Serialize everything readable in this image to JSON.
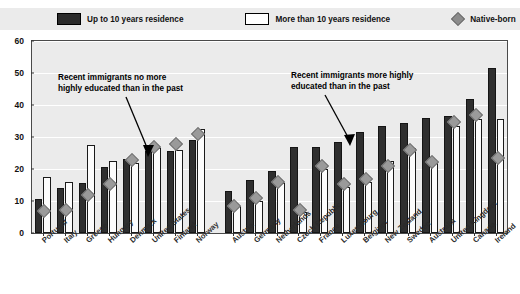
{
  "legend": {
    "items": [
      {
        "label": "Up to 10 years residence",
        "icon": "dark-square-swatch",
        "color": "#2b2b2b"
      },
      {
        "label": "More than 10 years residence",
        "icon": "light-square-swatch",
        "color": "#ffffff"
      },
      {
        "label": "Native-born",
        "icon": "grey-diamond-marker",
        "color": "#8c8c8c"
      }
    ]
  },
  "annotations": [
    {
      "name": "left-annotation",
      "line1": "Recent immigrants no more",
      "line2": "highly educated than in the past"
    },
    {
      "name": "right-annotation",
      "line1": "Recent immigrants more highly",
      "line2": "educated than in the past"
    }
  ],
  "chart_data": {
    "type": "bar",
    "title": "",
    "xlabel": "",
    "ylabel": "",
    "ylim": [
      0,
      60
    ],
    "yticks": [
      0,
      10,
      20,
      30,
      40,
      50,
      60
    ],
    "grid": true,
    "legend_position": "top",
    "groups": [
      {
        "name": "no-more-highly-educated",
        "categories": [
          "Portugal",
          "Italy",
          "Greece",
          "Hungary",
          "Denmark",
          "United States",
          "Finland",
          "Norway"
        ],
        "series": [
          {
            "name": "Up to 10 years residence",
            "values": [
              10.5,
              14.0,
              15.5,
              20.5,
              23.0,
              25.5,
              25.5,
              29.0
            ]
          },
          {
            "name": "More than 10 years residence",
            "values": [
              17.5,
              16.0,
              27.5,
              22.5,
              22.0,
              26.5,
              26.0,
              32.5
            ]
          },
          {
            "name": "Native-born",
            "values": [
              6.5,
              7.0,
              11.5,
              15.0,
              22.5,
              26.5,
              27.5,
              30.5
            ]
          }
        ]
      },
      {
        "name": "more-highly-educated",
        "categories": [
          "Austria",
          "Germany",
          "Netherlands",
          "Czech Republic",
          "France",
          "Luxembourg",
          "Belgium",
          "New Zealand",
          "Sweden",
          "Australia",
          "United Kingdom",
          "Canada",
          "Ireland"
        ],
        "series": [
          {
            "name": "Up to 10 years residence",
            "values": [
              13.0,
              16.5,
              19.5,
              27.0,
              27.0,
              28.5,
              31.5,
              33.5,
              34.5,
              36.0,
              36.5,
              42.0,
              51.5
            ]
          },
          {
            "name": "More than 10 years residence",
            "values": [
              8.5,
              10.0,
              15.5,
              6.5,
              20.0,
              14.5,
              16.0,
              22.5,
              26.5,
              22.5,
              33.5,
              35.5,
              35.5
            ]
          },
          {
            "name": "Native-born",
            "values": [
              8.0,
              10.5,
              15.5,
              7.0,
              20.5,
              15.0,
              16.5,
              20.5,
              25.5,
              22.0,
              34.5,
              36.5,
              23.0
            ]
          }
        ]
      }
    ]
  }
}
